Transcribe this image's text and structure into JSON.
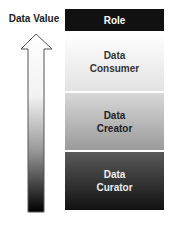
{
  "axis": {
    "label": "Data Value",
    "direction": "up"
  },
  "header": {
    "label": "Role"
  },
  "roles": [
    {
      "line1": "Data",
      "line2": "Consumer"
    },
    {
      "line1": "Data",
      "line2": "Creator"
    },
    {
      "line1": "Data",
      "line2": "Curator"
    }
  ]
}
